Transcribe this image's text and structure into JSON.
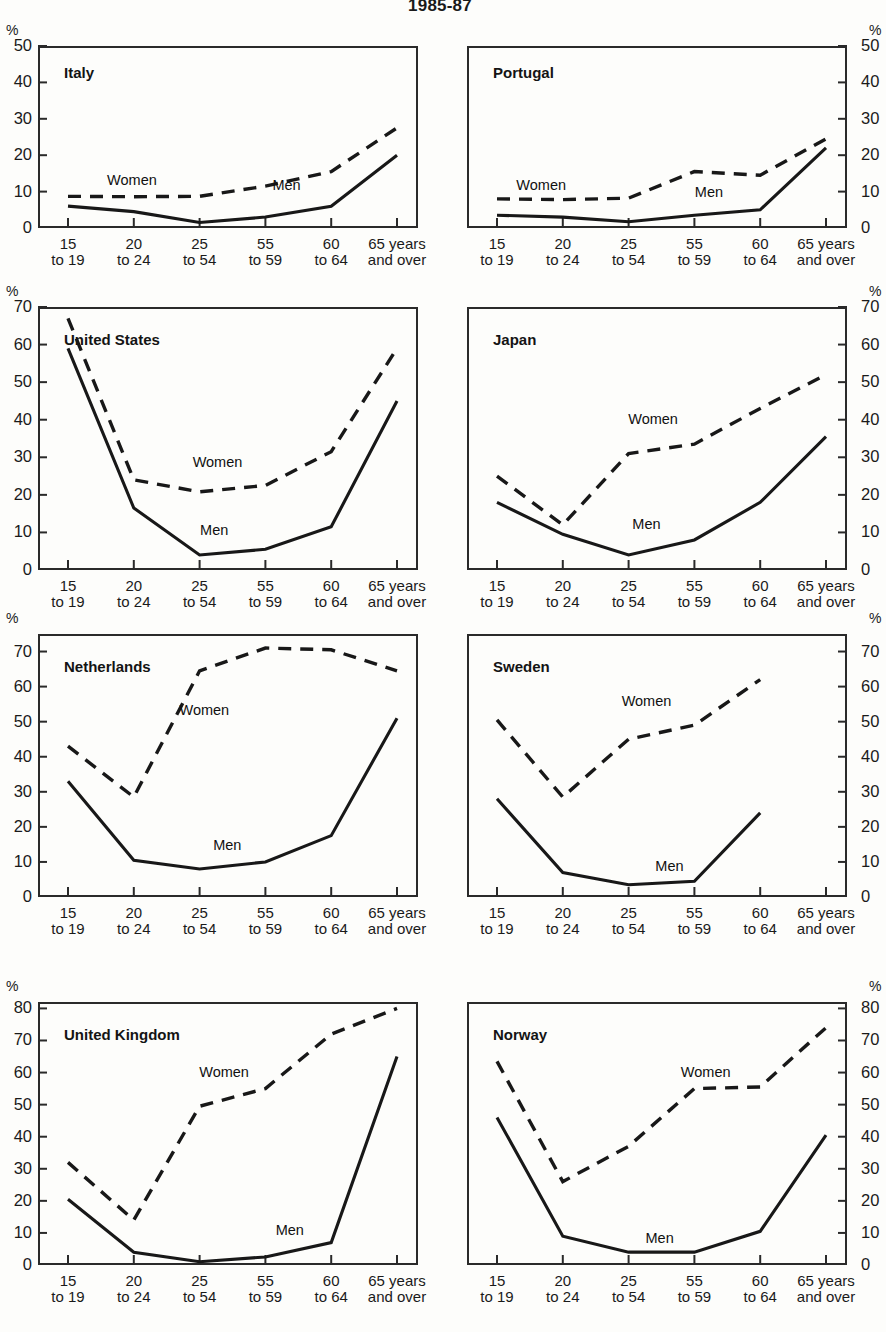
{
  "title": "1985-87",
  "axis": {
    "percent_symbol": "%",
    "categories": [
      {
        "top": "15",
        "bottom": "to 19"
      },
      {
        "top": "20",
        "bottom": "to 24"
      },
      {
        "top": "25",
        "bottom": "to 54"
      },
      {
        "top": "55",
        "bottom": "to 59"
      },
      {
        "top": "60",
        "bottom": "to 64"
      },
      {
        "top": "65 years",
        "bottom": "and over"
      }
    ],
    "series_labels": {
      "men": "Men",
      "women": "Women"
    }
  },
  "chart_data": {
    "type": "line",
    "title": "1985-87",
    "xlabel": "",
    "ylabel": "%",
    "grid": false,
    "legend": "inline-annotations",
    "categories": [
      "15 to 19",
      "20 to 24",
      "25 to 54",
      "55 to 59",
      "60 to 64",
      "65 years and over"
    ],
    "panels": [
      {
        "name": "Italy",
        "ylim": [
          0,
          50
        ],
        "yticks": [
          0,
          10,
          20,
          30,
          40,
          50
        ],
        "axis_side": "left",
        "series": [
          {
            "name": "Men",
            "values": [
              6,
              4.5,
              1.5,
              3,
              6,
              20
            ]
          },
          {
            "name": "Women",
            "values": [
              8.7,
              8.6,
              8.7,
              11.5,
              15.5,
              27.5
            ]
          }
        ]
      },
      {
        "name": "Portugal",
        "ylim": [
          0,
          50
        ],
        "yticks": [
          0,
          10,
          20,
          30,
          40,
          50
        ],
        "axis_side": "right",
        "series": [
          {
            "name": "Men",
            "values": [
              3.5,
              3,
              1.7,
              3.5,
              5,
              22
            ]
          },
          {
            "name": "Women",
            "values": [
              8,
              7.8,
              8.2,
              15.5,
              14.5,
              24.5
            ]
          }
        ]
      },
      {
        "name": "United States",
        "ylim": [
          0,
          70
        ],
        "yticks": [
          0,
          10,
          20,
          30,
          40,
          50,
          60,
          70
        ],
        "axis_side": "left",
        "series": [
          {
            "name": "Men",
            "values": [
              59,
              16.5,
              4,
              5.5,
              11.5,
              45
            ]
          },
          {
            "name": "Women",
            "values": [
              67,
              24,
              20.8,
              22.5,
              31.5,
              59
            ]
          }
        ]
      },
      {
        "name": "Japan",
        "ylim": [
          0,
          70
        ],
        "yticks": [
          0,
          10,
          20,
          30,
          40,
          50,
          60,
          70
        ],
        "axis_side": "right",
        "series": [
          {
            "name": "Men",
            "values": [
              18,
              9.5,
              4,
              8,
              18,
              35.5
            ]
          },
          {
            "name": "Women",
            "values": [
              25,
              12,
              31,
              33.5,
              43,
              52
            ]
          }
        ]
      },
      {
        "name": "Netherlands",
        "ylim": [
          0,
          75
        ],
        "yticks": [
          0,
          10,
          20,
          30,
          40,
          50,
          60,
          70
        ],
        "axis_side": "left",
        "series": [
          {
            "name": "Men",
            "values": [
              33,
              10.5,
              8,
              10,
              17.5,
              51
            ]
          },
          {
            "name": "Women",
            "values": [
              43,
              28.5,
              64.5,
              71,
              70.5,
              64.5
            ]
          }
        ]
      },
      {
        "name": "Sweden",
        "ylim": [
          0,
          75
        ],
        "yticks": [
          0,
          10,
          20,
          30,
          40,
          50,
          60,
          70
        ],
        "axis_side": "right",
        "series": [
          {
            "name": "Men",
            "values": [
              28,
              7,
              3.5,
              4.5,
              24,
              null
            ]
          },
          {
            "name": "Women",
            "values": [
              50.5,
              28.5,
              45,
              49,
              62,
              null
            ]
          }
        ]
      },
      {
        "name": "United Kingdom",
        "ylim": [
          0,
          82
        ],
        "yticks": [
          0,
          10,
          20,
          30,
          40,
          50,
          60,
          70,
          80
        ],
        "axis_side": "left",
        "series": [
          {
            "name": "Men",
            "values": [
              20.5,
              4,
              1,
              2.5,
              7,
              65
            ]
          },
          {
            "name": "Women",
            "values": [
              32,
              14,
              49.5,
              55,
              72,
              80
            ]
          }
        ]
      },
      {
        "name": "Norway",
        "ylim": [
          0,
          82
        ],
        "yticks": [
          0,
          10,
          20,
          30,
          40,
          50,
          60,
          70,
          80
        ],
        "axis_side": "right",
        "series": [
          {
            "name": "Men",
            "values": [
              46,
              9,
              4,
              4,
              10.5,
              40.5
            ]
          },
          {
            "name": "Women",
            "values": [
              63.5,
              26,
              37,
              55,
              55.5,
              74
            ]
          }
        ]
      }
    ]
  }
}
